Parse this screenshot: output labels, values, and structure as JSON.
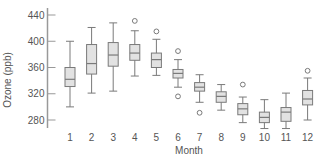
{
  "chart_data": {
    "type": "boxplot",
    "title": "",
    "xlabel": "Month",
    "ylabel": "Ozone (ppb)",
    "ylim": [
      265,
      450
    ],
    "yticks": [
      280,
      320,
      360,
      400,
      440
    ],
    "categories": [
      "1",
      "2",
      "3",
      "4",
      "5",
      "6",
      "7",
      "8",
      "9",
      "10",
      "11",
      "12"
    ],
    "grid": false,
    "colors": {
      "box_fill": "#e2e2e2",
      "line": "#7a7a7a",
      "axis": "#999999",
      "text": "#555555"
    },
    "boxes": [
      {
        "month": "1",
        "whisker_low": 300,
        "q1": 331,
        "median": 342,
        "q3": 360,
        "whisker_high": 400,
        "outliers": []
      },
      {
        "month": "2",
        "whisker_low": 321,
        "q1": 350,
        "median": 366,
        "q3": 395,
        "whisker_high": 421,
        "outliers": []
      },
      {
        "month": "3",
        "whisker_low": 324,
        "q1": 362,
        "median": 379,
        "q3": 398,
        "whisker_high": 428,
        "outliers": []
      },
      {
        "month": "4",
        "whisker_low": 347,
        "q1": 371,
        "median": 382,
        "q3": 395,
        "whisker_high": 416,
        "outliers": [
          431
        ]
      },
      {
        "month": "5",
        "whisker_low": 348,
        "q1": 360,
        "median": 372,
        "q3": 382,
        "whisker_high": 403,
        "outliers": [
          415
        ]
      },
      {
        "month": "6",
        "whisker_low": 330,
        "q1": 344,
        "median": 351,
        "q3": 357,
        "whisker_high": 372,
        "outliers": [
          385,
          316
        ]
      },
      {
        "month": "7",
        "whisker_low": 307,
        "q1": 324,
        "median": 330,
        "q3": 337,
        "whisker_high": 349,
        "outliers": [
          291
        ]
      },
      {
        "month": "8",
        "whisker_low": 295,
        "q1": 307,
        "median": 316,
        "q3": 323,
        "whisker_high": 334,
        "outliers": []
      },
      {
        "month": "9",
        "whisker_low": 276,
        "q1": 288,
        "median": 297,
        "q3": 305,
        "whisker_high": 315,
        "outliers": [
          334
        ]
      },
      {
        "month": "10",
        "whisker_low": 267,
        "q1": 276,
        "median": 284,
        "q3": 292,
        "whisker_high": 311,
        "outliers": []
      },
      {
        "month": "11",
        "whisker_low": 267,
        "q1": 278,
        "median": 292,
        "q3": 299,
        "whisker_high": 321,
        "outliers": []
      },
      {
        "month": "12",
        "whisker_low": 280,
        "q1": 303,
        "median": 312,
        "q3": 325,
        "whisker_high": 344,
        "outliers": [
          355
        ]
      }
    ]
  }
}
